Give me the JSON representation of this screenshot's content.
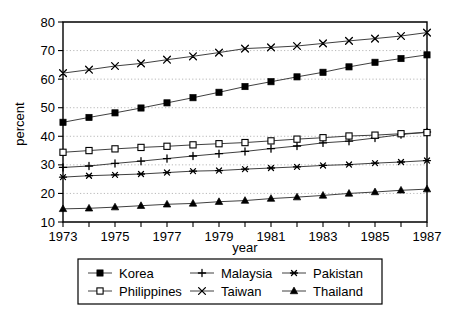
{
  "chart_data": {
    "type": "line",
    "title": "",
    "xlabel": "year",
    "ylabel": "percent",
    "xlim": [
      1973,
      1987
    ],
    "ylim": [
      10,
      80
    ],
    "yticks": [
      10,
      20,
      30,
      40,
      50,
      60,
      70,
      80
    ],
    "xticks": [
      1973,
      1975,
      1977,
      1979,
      1981,
      1983,
      1985,
      1987
    ],
    "xtick_labels": [
      "1973",
      "1975",
      "1977",
      "1979",
      "1981",
      "1983",
      "1985",
      "1987"
    ],
    "ytick_labels": [
      "10",
      "20",
      "30",
      "40",
      "50",
      "60",
      "70",
      "80"
    ],
    "x": [
      1973,
      1974,
      1975,
      1976,
      1977,
      1978,
      1979,
      1980,
      1981,
      1982,
      1983,
      1984,
      1985,
      1986,
      1987
    ],
    "grid": true,
    "grid_axis": "y",
    "legend_position": "below",
    "legend_columns": 3,
    "series": [
      {
        "name": "Korea",
        "marker": "filled-square",
        "values": [
          44.9,
          46.6,
          48.2,
          49.9,
          51.7,
          53.5,
          55.4,
          57.4,
          59.1,
          60.8,
          62.4,
          64.3,
          65.9,
          67.2,
          68.5
        ]
      },
      {
        "name": "Malaysia",
        "marker": "plus",
        "values": [
          29.1,
          29.6,
          30.5,
          31.3,
          32.2,
          33.1,
          33.9,
          34.7,
          35.7,
          36.6,
          37.7,
          38.3,
          39.4,
          40.6,
          41.5
        ]
      },
      {
        "name": "Pakistan",
        "marker": "asterisk",
        "values": [
          25.7,
          26.2,
          26.5,
          26.8,
          27.3,
          27.8,
          28.0,
          28.5,
          28.9,
          29.3,
          29.8,
          30.1,
          30.6,
          31.0,
          31.5
        ]
      },
      {
        "name": "Philippines",
        "marker": "open-square",
        "values": [
          34.4,
          35.0,
          35.6,
          36.1,
          36.5,
          37.0,
          37.4,
          37.8,
          38.4,
          39.0,
          39.5,
          40.1,
          40.4,
          40.9,
          41.3
        ]
      },
      {
        "name": "Taiwan",
        "marker": "cross",
        "values": [
          62.1,
          63.3,
          64.6,
          65.5,
          66.8,
          68.0,
          69.3,
          70.7,
          71.1,
          71.6,
          72.5,
          73.4,
          74.2,
          75.1,
          76.3
        ]
      },
      {
        "name": "Thailand",
        "marker": "filled-triangle",
        "values": [
          14.6,
          14.8,
          15.2,
          15.7,
          16.2,
          16.5,
          17.1,
          17.5,
          18.2,
          18.7,
          19.3,
          20.0,
          20.5,
          21.1,
          21.5
        ]
      }
    ]
  },
  "legend": {
    "entries": [
      {
        "label": "Korea",
        "marker": "filled-square"
      },
      {
        "label": "Malaysia",
        "marker": "plus"
      },
      {
        "label": "Pakistan",
        "marker": "asterisk"
      },
      {
        "label": "Philippines",
        "marker": "open-square"
      },
      {
        "label": "Taiwan",
        "marker": "cross"
      },
      {
        "label": "Thailand",
        "marker": "filled-triangle"
      }
    ]
  },
  "colors": {
    "line": "#2a2a2a",
    "axis": "#000000",
    "grid": "#9a9a9a",
    "background": "#ffffff"
  }
}
